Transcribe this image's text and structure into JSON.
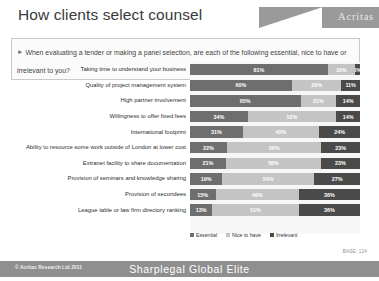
{
  "header": {
    "title": "How clients select counsel",
    "logo_text": "Acritas",
    "logo_icon": "wedge-logo-icon"
  },
  "question": {
    "bullet_icon": "triangle-right-icon",
    "text": "When evaluating a tender or making a panel selection, are each of the following essential, nice to have or irrelevant to you?"
  },
  "legend": [
    {
      "label": "Essential",
      "color": "#6e6e6e",
      "key": "essential"
    },
    {
      "label": "Nice to have",
      "color": "#c4c4c4",
      "key": "nice"
    },
    {
      "label": "Irrelevant",
      "color": "#4a4a4a",
      "key": "irrelevant"
    }
  ],
  "base_note": "BASE: 124",
  "footer": {
    "copyright": "© Acritas Research Ltd 2011",
    "brand": "Sharplegal Global Elite"
  },
  "chart_data": {
    "type": "bar",
    "orientation": "horizontal",
    "stacked": true,
    "stacked_percent": true,
    "title": "How clients select counsel",
    "xlabel": "",
    "ylabel": "",
    "xlim": [
      0,
      100
    ],
    "grid": false,
    "legend_position": "bottom",
    "series": [
      {
        "name": "Essential",
        "color": "#6e6e6e",
        "values": [
          81,
          60,
          65,
          34,
          31,
          22,
          21,
          19,
          15,
          13
        ]
      },
      {
        "name": "Nice to have",
        "color": "#c4c4c4",
        "values": [
          16,
          29,
          21,
          52,
          45,
          56,
          56,
          54,
          49,
          51
        ]
      },
      {
        "name": "Irrelevant",
        "color": "#4a4a4a",
        "values": [
          3,
          11,
          14,
          14,
          24,
          23,
          23,
          27,
          36,
          36
        ]
      }
    ],
    "categories": [
      "Taking time to understand your business",
      "Quality of project management system",
      "High partner involvement",
      "Willingness to offer fixed fees",
      "International footprint",
      "Ability to resource some work outside of London at lower cost",
      "Extranet facility to share documentation",
      "Provision of seminars and knowledge sharing",
      "Provision of secondees",
      "League table or law firm directory ranking"
    ],
    "rows": [
      {
        "category": "Taking time to understand your business",
        "essential": "81%",
        "nice": "16%",
        "irrelevant": "3%",
        "e": 81,
        "n": 16,
        "i": 3
      },
      {
        "category": "Quality of project management system",
        "essential": "60%",
        "nice": "29%",
        "irrelevant": "11%",
        "e": 60,
        "n": 29,
        "i": 11
      },
      {
        "category": "High partner involvement",
        "essential": "65%",
        "nice": "21%",
        "irrelevant": "14%",
        "e": 65,
        "n": 21,
        "i": 14
      },
      {
        "category": "Willingness to offer fixed fees",
        "essential": "34%",
        "nice": "52%",
        "irrelevant": "14%",
        "e": 34,
        "n": 52,
        "i": 14
      },
      {
        "category": "International footprint",
        "essential": "31%",
        "nice": "45%",
        "irrelevant": "24%",
        "e": 31,
        "n": 45,
        "i": 24
      },
      {
        "category": "Ability to resource some work outside of London at lower cost",
        "essential": "22%",
        "nice": "56%",
        "irrelevant": "23%",
        "e": 22,
        "n": 56,
        "i": 23
      },
      {
        "category": "Extranet facility to share documentation",
        "essential": "21%",
        "nice": "56%",
        "irrelevant": "23%",
        "e": 21,
        "n": 56,
        "i": 23
      },
      {
        "category": "Provision of seminars and knowledge sharing",
        "essential": "19%",
        "nice": "54%",
        "irrelevant": "27%",
        "e": 19,
        "n": 54,
        "i": 27
      },
      {
        "category": "Provision of secondees",
        "essential": "15%",
        "nice": "49%",
        "irrelevant": "36%",
        "e": 15,
        "n": 49,
        "i": 36
      },
      {
        "category": "League table or law firm directory ranking",
        "essential": "13%",
        "nice": "51%",
        "irrelevant": "36%",
        "e": 13,
        "n": 51,
        "i": 36
      }
    ]
  }
}
